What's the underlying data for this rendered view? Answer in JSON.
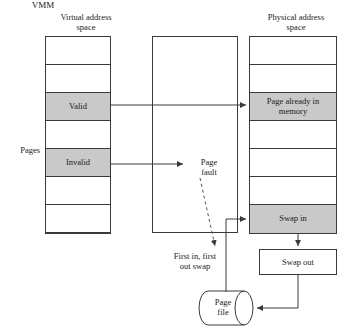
{
  "diagram": {
    "headers": {
      "virtual": "Virtual address\nspace",
      "vmm": "VMM",
      "physical": "Physical address\nspace"
    },
    "side_label": "Pages",
    "virtual_column": {
      "rows": [
        {
          "label": "",
          "shaded": false
        },
        {
          "label": "",
          "shaded": false
        },
        {
          "label": "Valid",
          "shaded": true
        },
        {
          "label": "",
          "shaded": false
        },
        {
          "label": "Invalid",
          "shaded": true
        },
        {
          "label": "",
          "shaded": false
        },
        {
          "label": "",
          "shaded": false
        }
      ]
    },
    "physical_column": {
      "rows": [
        {
          "label": "",
          "shaded": false
        },
        {
          "label": "",
          "shaded": false
        },
        {
          "label": "Page already in\nmemory",
          "shaded": true
        },
        {
          "label": "",
          "shaded": false
        },
        {
          "label": "",
          "shaded": false
        },
        {
          "label": "",
          "shaded": false
        },
        {
          "label": "Swap in",
          "shaded": true
        }
      ]
    },
    "vmm_labels": {
      "page_fault": "Page\nfault",
      "fifo_swap": "First in, first\nout swap"
    },
    "swap_out_box": "Swap out",
    "page_file": "Page\nfile",
    "colors": {
      "shaded_cell": "#c9c9c9",
      "stroke": "#3a3a3a",
      "text": "#1a1a1a",
      "background": "#ffffff"
    }
  }
}
